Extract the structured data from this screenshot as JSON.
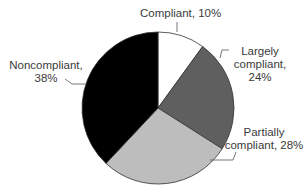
{
  "chart_data": {
    "type": "pie",
    "title": "",
    "categories": [
      "Compliant",
      "Largely compliant",
      "Partially compliant",
      "Noncompliant"
    ],
    "values": [
      10,
      24,
      28,
      38
    ],
    "unit": "%",
    "colors": [
      "#ffffff",
      "#5f5f5f",
      "#bdbdbd",
      "#000000"
    ],
    "start_angle": "12 o'clock, clockwise",
    "legend": "none (callout labels)"
  },
  "labels": {
    "compliant": {
      "line1": "Compliant, 10%"
    },
    "largely": {
      "line1": "Largely",
      "line2": "compliant,",
      "line3": "24%"
    },
    "partially": {
      "line1": "Partially",
      "line2": "compliant, 28%"
    },
    "noncompliant": {
      "line1": "Noncompliant,",
      "line2": "38%"
    }
  }
}
